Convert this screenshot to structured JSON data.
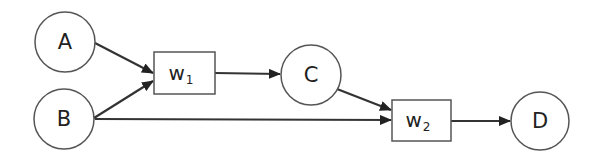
{
  "diagram": {
    "colors": {
      "stroke": "#333333",
      "node_stroke": "#555555",
      "fill": "#ffffff",
      "text": "#222222"
    },
    "nodes": [
      {
        "id": "A",
        "label": "A",
        "shape": "circle",
        "cx": 65,
        "cy": 42,
        "r": 30
      },
      {
        "id": "B",
        "label": "B",
        "shape": "circle",
        "cx": 64,
        "cy": 119,
        "r": 30
      },
      {
        "id": "C",
        "label": "C",
        "shape": "circle",
        "cx": 311,
        "cy": 75,
        "r": 30
      },
      {
        "id": "D",
        "label": "D",
        "shape": "circle",
        "cx": 540,
        "cy": 121,
        "r": 29
      }
    ],
    "boxes": [
      {
        "id": "w1",
        "label": "w",
        "subscript": "1",
        "x": 154,
        "y": 52,
        "w": 61,
        "h": 42
      },
      {
        "id": "w2",
        "label": "w",
        "subscript": "2",
        "x": 392,
        "y": 100,
        "w": 59,
        "h": 41
      }
    ],
    "edges": [
      {
        "from": "A",
        "to": "w1"
      },
      {
        "from": "B",
        "to": "w1"
      },
      {
        "from": "w1",
        "to": "C"
      },
      {
        "from": "C",
        "to": "w2"
      },
      {
        "from": "B",
        "to": "w2"
      },
      {
        "from": "w2",
        "to": "D"
      }
    ]
  }
}
